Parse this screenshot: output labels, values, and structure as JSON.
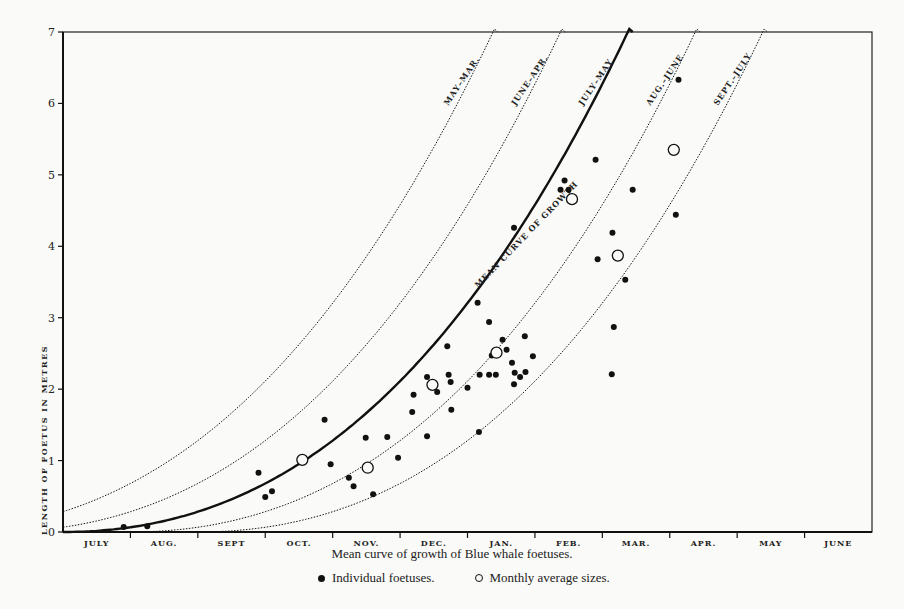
{
  "caption": "Mean curve of growth of Blue whale foetuses.",
  "legend": {
    "individual": "Individual foetuses.",
    "average": "Monthly average sizes."
  },
  "chart_data": {
    "type": "scatter",
    "title": "Mean curve of growth of Blue whale foetuses.",
    "xlabel": "",
    "ylabel": "LENGTH OF FOETUS IN METRES",
    "ylim": [
      0,
      7
    ],
    "yticks": [
      0,
      1,
      2,
      3,
      4,
      5,
      6,
      7
    ],
    "xlim": [
      0,
      12
    ],
    "categories": [
      "JULY",
      "AUG.",
      "SEPT",
      "OCT.",
      "NOV.",
      "DEC.",
      "JAN.",
      "FEB.",
      "MAR.",
      "APR.",
      "MAY",
      "JUNE"
    ],
    "grid": false,
    "legend_position": "bottom",
    "curves": [
      {
        "name": "MAY–MAR.",
        "style": "dotted",
        "offset_months": -2
      },
      {
        "name": "JUNE–APR.",
        "style": "dotted",
        "offset_months": -1
      },
      {
        "name": "JULY–MAY",
        "style": "solid",
        "offset_months": 0,
        "annotation": "MEAN CURVE OF GROWTH"
      },
      {
        "name": "AUG.–JUNE",
        "style": "dotted",
        "offset_months": 1
      },
      {
        "name": "SEPT.–JULY",
        "style": "dotted",
        "offset_months": 2
      }
    ],
    "mean_curve": {
      "x": [
        0,
        1,
        2,
        3,
        4,
        5,
        6,
        7,
        8,
        9,
        10
      ],
      "y": [
        0.0,
        0.12,
        0.35,
        0.68,
        1.12,
        1.7,
        2.5,
        3.5,
        4.8,
        6.4,
        8.2
      ]
    },
    "series": [
      {
        "name": "Individual foetuses.",
        "marker": "filled-circle",
        "points": [
          [
            0.9,
            0.07
          ],
          [
            1.25,
            0.08
          ],
          [
            2.9,
            0.83
          ],
          [
            3.0,
            0.49
          ],
          [
            3.1,
            0.57
          ],
          [
            3.88,
            1.57
          ],
          [
            3.97,
            0.95
          ],
          [
            4.24,
            0.76
          ],
          [
            4.31,
            0.64
          ],
          [
            4.49,
            1.32
          ],
          [
            4.6,
            0.53
          ],
          [
            4.81,
            1.33
          ],
          [
            4.97,
            1.04
          ],
          [
            5.18,
            1.68
          ],
          [
            5.2,
            1.92
          ],
          [
            5.4,
            2.17
          ],
          [
            5.4,
            1.34
          ],
          [
            5.55,
            1.96
          ],
          [
            5.7,
            2.6
          ],
          [
            5.72,
            2.2
          ],
          [
            5.75,
            2.1
          ],
          [
            5.76,
            1.71
          ],
          [
            6.0,
            2.02
          ],
          [
            6.15,
            3.21
          ],
          [
            6.17,
            1.4
          ],
          [
            6.18,
            2.2
          ],
          [
            6.32,
            2.94
          ],
          [
            6.32,
            2.2
          ],
          [
            6.36,
            2.47
          ],
          [
            6.42,
            2.2
          ],
          [
            6.52,
            2.69
          ],
          [
            6.58,
            2.55
          ],
          [
            6.66,
            2.37
          ],
          [
            6.7,
            2.23
          ],
          [
            6.69,
            2.07
          ],
          [
            6.78,
            2.17
          ],
          [
            6.85,
            2.74
          ],
          [
            6.86,
            2.24
          ],
          [
            6.97,
            2.46
          ],
          [
            6.69,
            4.26
          ],
          [
            7.38,
            4.79
          ],
          [
            7.44,
            4.92
          ],
          [
            7.5,
            4.79
          ],
          [
            7.9,
            5.21
          ],
          [
            7.93,
            3.82
          ],
          [
            8.15,
            4.19
          ],
          [
            8.17,
            2.87
          ],
          [
            8.14,
            2.21
          ],
          [
            8.34,
            3.53
          ],
          [
            8.45,
            4.79
          ],
          [
            9.09,
            4.44
          ],
          [
            9.13,
            6.33
          ]
        ]
      },
      {
        "name": "Monthly average sizes.",
        "marker": "open-circle",
        "points": [
          [
            3.55,
            1.01
          ],
          [
            4.52,
            0.9
          ],
          [
            5.48,
            2.06
          ],
          [
            6.43,
            2.51
          ],
          [
            7.55,
            4.66
          ],
          [
            8.23,
            3.87
          ],
          [
            9.06,
            5.35
          ]
        ]
      }
    ]
  }
}
